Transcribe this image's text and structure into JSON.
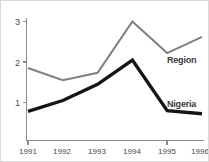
{
  "chart_data": {
    "type": "line",
    "title": "",
    "subtitle": "",
    "xlabel": "",
    "ylabel": "",
    "categories": [
      "1991",
      "1992",
      "1993",
      "1994",
      "1995",
      "1996"
    ],
    "x": [
      1991,
      1992,
      1993,
      1994,
      1995,
      1996
    ],
    "series": [
      {
        "name": "Region",
        "color": "#808080",
        "values": [
          1.85,
          1.55,
          1.73,
          3.0,
          2.22,
          2.62
        ]
      },
      {
        "name": "Nigeria",
        "color": "#141414",
        "values": [
          0.78,
          1.05,
          1.45,
          2.05,
          0.8,
          0.72
        ]
      }
    ],
    "xlim": [
      1991,
      1996
    ],
    "ylim": [
      0,
      3.25
    ],
    "yticks": [
      1,
      2,
      3
    ],
    "ytick_labels": [
      "1",
      "2",
      "3"
    ],
    "xtick_labels": [
      "1991",
      "1992",
      "1993",
      "1994",
      "1995",
      "1996"
    ],
    "grid": false,
    "legend": "inline-labels",
    "legend_position": "right-inline"
  },
  "axis": {
    "y_ticks": [
      {
        "label": "3",
        "value": 3
      },
      {
        "label": "2",
        "value": 2
      },
      {
        "label": "1",
        "value": 1
      }
    ],
    "x_ticks": [
      {
        "label": "1991"
      },
      {
        "label": "1992"
      },
      {
        "label": "1993"
      },
      {
        "label": "1994"
      },
      {
        "label": "1995"
      },
      {
        "label": "1996"
      }
    ]
  },
  "labels": {
    "region": "Region",
    "nigeria": "Nigeria"
  },
  "colors": {
    "region_line": "#808080",
    "nigeria_line": "#141414",
    "axis": "#8c8c8c",
    "text": "#4a4a4a",
    "background": "#ffffff"
  }
}
